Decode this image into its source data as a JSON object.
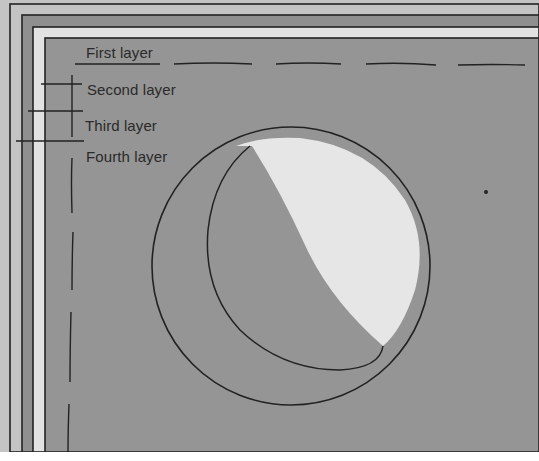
{
  "diagram": {
    "labels": [
      {
        "id": "first",
        "text": "First layer"
      },
      {
        "id": "second",
        "text": "Second layer"
      },
      {
        "id": "third",
        "text": "Third layer"
      },
      {
        "id": "fourth",
        "text": "Fourth layer"
      }
    ],
    "colors": {
      "outer_band": "#c4c4c4",
      "second_band": "#8f8f8f",
      "third_band": "#e2e2e2",
      "inner_field": "#959595",
      "cutout_highlight": "#e6e6e6",
      "line": "#222222"
    }
  }
}
